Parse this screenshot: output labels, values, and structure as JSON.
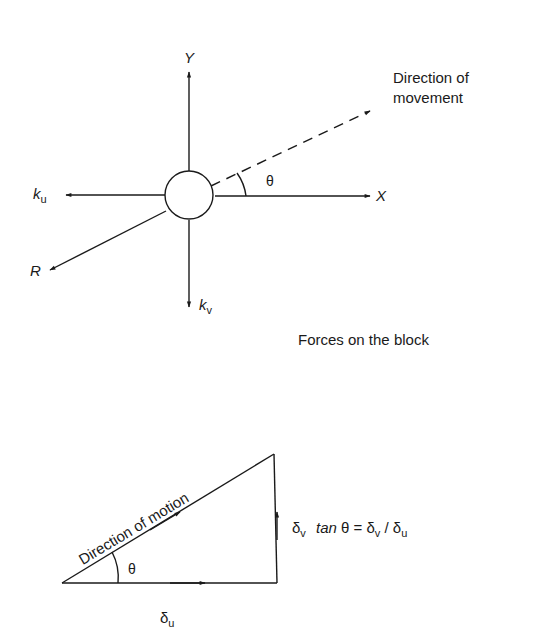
{
  "figure_1": {
    "caption": "Forces on the block",
    "axes": {
      "x_label": "X",
      "y_label": "Y"
    },
    "forces": {
      "ku_symbol": "k",
      "ku_sub": "u",
      "kv_symbol": "k",
      "kv_sub": "v",
      "resultant": "R"
    },
    "movement_label_line1": "Direction of",
    "movement_label_line2": "movement",
    "angle": "θ"
  },
  "figure_2": {
    "hypotenuse_label": "Direction of motion",
    "angle": "θ",
    "horizontal_symbol": "δ",
    "horizontal_sub": "u",
    "vertical_symbol": "δ",
    "vertical_sub": "v",
    "equation_tan": "tan",
    "equation_rest_1": " θ = δ",
    "equation_sub_v": "v",
    "equation_rest_2": " / δ",
    "equation_sub_u": "u"
  },
  "colors": {
    "ink": "#1a1a1a",
    "background": "#ffffff"
  }
}
